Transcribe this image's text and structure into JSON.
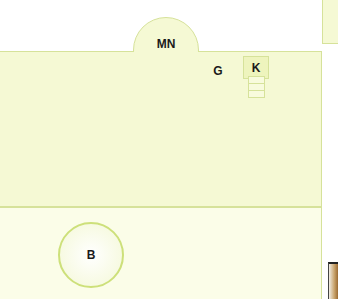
{
  "map": {
    "type": "floor-plan",
    "colors": {
      "room_fill": "#f5f9d4",
      "lower_fill": "#fbfde8",
      "outline": "#d6e29a",
      "circle_outline": "#cde07a",
      "label_text": "#1a1a1a"
    },
    "areas": [
      {
        "id": "MN",
        "label": "MN",
        "shape": "semicircle-alcove"
      },
      {
        "id": "G",
        "label": "G",
        "shape": "text-marker"
      },
      {
        "id": "K",
        "label": "K",
        "shape": "box-with-stack"
      },
      {
        "id": "B",
        "label": "B",
        "shape": "circle"
      }
    ]
  }
}
